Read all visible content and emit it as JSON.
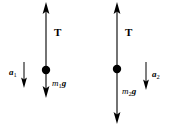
{
  "figure": {
    "width": 175,
    "height": 136,
    "background_color": "#ffffff",
    "stroke_color": "#000000"
  },
  "bodies": [
    {
      "id": "mass-1",
      "dot": {
        "cx": 46,
        "cy": 70,
        "r": 4.2
      },
      "tension": {
        "label": "T",
        "label_x": 54,
        "label_y": 27,
        "arrow": {
          "x": 46,
          "y_tail": 70,
          "y_head": 2,
          "direction": "up"
        }
      },
      "weight": {
        "symbol": "m",
        "subscript": "1",
        "gravity": "g",
        "label_x": 52,
        "label_y": 79,
        "arrow": {
          "x": 46,
          "y_tail": 70,
          "y_head": 98,
          "direction": "down"
        }
      },
      "acceleration": {
        "symbol": "a",
        "subscript": "1",
        "label_x": 9,
        "label_y": 68,
        "arrow": {
          "x": 24,
          "y_tail": 62,
          "y_head": 88,
          "direction": "down"
        }
      }
    },
    {
      "id": "mass-2",
      "dot": {
        "cx": 117,
        "cy": 69,
        "r": 4.2
      },
      "tension": {
        "label": "T",
        "label_x": 125,
        "label_y": 27,
        "arrow": {
          "x": 117,
          "y_tail": 69,
          "y_head": 2,
          "direction": "up"
        }
      },
      "weight": {
        "symbol": "m",
        "subscript": "2",
        "gravity": "g",
        "label_x": 122,
        "label_y": 87,
        "arrow": {
          "x": 117,
          "y_tail": 69,
          "y_head": 124,
          "direction": "down"
        }
      },
      "acceleration": {
        "symbol": "a",
        "subscript": "2",
        "label_x": 152,
        "label_y": 70,
        "arrow": {
          "x": 146,
          "y_tail": 62,
          "y_head": 90,
          "direction": "down"
        }
      }
    }
  ],
  "labels": {
    "tension_1": "T",
    "tension_2": "T",
    "weight_1_symbol": "m",
    "weight_1_sub": "1",
    "weight_1_g": "g",
    "weight_2_symbol": "m",
    "weight_2_sub": "2",
    "weight_2_g": "g",
    "accel_1_symbol": "a",
    "accel_1_sub": "1",
    "accel_2_symbol": "a",
    "accel_2_sub": "2"
  }
}
